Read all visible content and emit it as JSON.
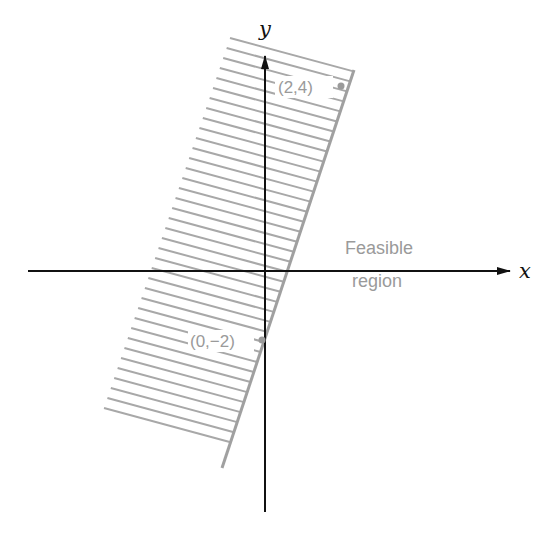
{
  "figure": {
    "x_axis_label": "x",
    "y_axis_label": "y",
    "region_label_line1": "Feasible",
    "region_label_line2": "region",
    "points": [
      {
        "label": "(2,4)",
        "x": 2,
        "y": 4
      },
      {
        "label": "(0,−2)",
        "x": 0,
        "y": -2
      }
    ],
    "boundary_line": "through (0,-2) and (2,4)",
    "shaded_side": "left of boundary line",
    "colors": {
      "axes": "#111111",
      "boundary": "#a0a0a0",
      "hatch": "#a8a8a8",
      "labels": "#9a9a9a"
    }
  },
  "geometry": {
    "origin": [
      265,
      271
    ],
    "x_axis": {
      "x1": 28,
      "x2": 510,
      "y": 271
    },
    "y_axis": {
      "x": 265,
      "y1": 512,
      "y2": 56
    },
    "boundary": {
      "x1": 354,
      "y1": 70,
      "x2": 222,
      "y2": 468
    },
    "hatch_left_edge": {
      "x1": 230,
      "y1": 38,
      "x2": 104,
      "y2": 408
    },
    "hatch_slope": 0.27,
    "hatch_count": 38,
    "point_markers": [
      [
        341,
        86
      ],
      [
        262,
        340
      ]
    ]
  }
}
